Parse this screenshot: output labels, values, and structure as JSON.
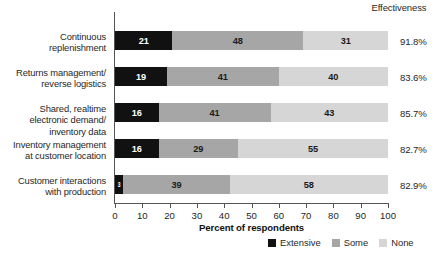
{
  "header": {
    "effectiveness_label": "Effectiveness"
  },
  "axis": {
    "xlabel": "Percent of respondents",
    "ticks": [
      0,
      10,
      20,
      30,
      40,
      50,
      60,
      70,
      80,
      90,
      100
    ]
  },
  "legend": {
    "items": [
      {
        "label": "Extensive",
        "color": "#111111",
        "key": "extensive"
      },
      {
        "label": "Some",
        "color": "#a6a6a6",
        "key": "some"
      },
      {
        "label": "None",
        "color": "#d6d6d6",
        "key": "none"
      }
    ]
  },
  "chart_data": {
    "type": "bar",
    "orientation": "horizontal",
    "stacked": true,
    "title": "",
    "xlabel": "Percent of respondents",
    "ylabel": "",
    "xlim": [
      0,
      100
    ],
    "xticks": [
      0,
      10,
      20,
      30,
      40,
      50,
      60,
      70,
      80,
      90,
      100
    ],
    "grid": false,
    "legend_position": "bottom-right",
    "categories": [
      "Continuous\nreplenishment",
      "Returns management/\nreverse logistics",
      "Shared, realtime\nelectronic demand/\ninventory data",
      "Inventory management\nat customer location",
      "Customer interactions\nwith production"
    ],
    "series": [
      {
        "name": "Extensive",
        "color": "#111111",
        "values": [
          21,
          19,
          16,
          16,
          3
        ]
      },
      {
        "name": "Some",
        "color": "#a6a6a6",
        "values": [
          48,
          41,
          41,
          29,
          39
        ]
      },
      {
        "name": "None",
        "color": "#d6d6d6",
        "values": [
          31,
          40,
          43,
          55,
          58
        ]
      }
    ],
    "annotations": {
      "column_label": "Effectiveness",
      "effectiveness": [
        "91.8%",
        "83.6%",
        "85.7%",
        "82.7%",
        "82.9%"
      ]
    }
  },
  "rows": [
    {
      "label": "Continuous\nreplenishment",
      "extensive": 21,
      "some": 48,
      "none": 31,
      "effectiveness": "91.8%",
      "top": 17
    },
    {
      "label": "Returns management/\nreverse logistics",
      "extensive": 19,
      "some": 41,
      "none": 40,
      "effectiveness": "83.6%",
      "top": 53
    },
    {
      "label": "Shared, realtime\nelectronic demand/\ninventory data",
      "extensive": 16,
      "some": 41,
      "none": 43,
      "effectiveness": "85.7%",
      "top": 89
    },
    {
      "label": "Inventory management\nat customer location",
      "extensive": 16,
      "some": 29,
      "none": 55,
      "effectiveness": "82.7%",
      "top": 125
    },
    {
      "label": "Customer interactions\nwith production",
      "extensive": 3,
      "some": 39,
      "none": 58,
      "effectiveness": "82.9%",
      "top": 161
    }
  ]
}
